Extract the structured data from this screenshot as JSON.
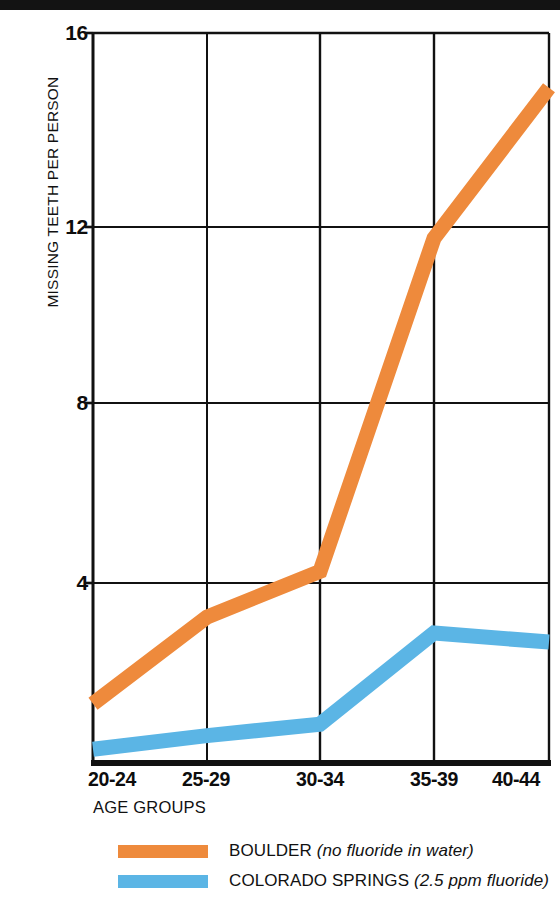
{
  "chart_data": {
    "type": "line",
    "title": "",
    "xlabel": "AGE GROUPS",
    "ylabel": "MISSING TEETH PER PERSON",
    "categories": [
      "20-24",
      "25-29",
      "30-34",
      "35-39",
      "40-44"
    ],
    "ylim": [
      0,
      16
    ],
    "yticks": [
      4,
      8,
      12,
      16
    ],
    "ytick_labels": [
      "4",
      "8",
      "12",
      "16"
    ],
    "grid": "vertical-and-horizontal",
    "legend_position": "bottom",
    "series": [
      {
        "name": "BOULDER",
        "note": "(no fluoride in water)",
        "color": "#ee8a3c",
        "values": [
          1.3,
          3.2,
          4.2,
          11.5,
          14.8
        ]
      },
      {
        "name": "COLORADO SPRINGS",
        "note": "(2.5 ppm fluoride)",
        "color": "#5bb5e5",
        "values": [
          0.3,
          0.6,
          0.85,
          2.85,
          2.65
        ]
      }
    ]
  },
  "axis": {
    "y_label": "MISSING TEETH PER PERSON",
    "x_label": "AGE GROUPS",
    "y_ticks": [
      "16",
      "12",
      "8",
      "4"
    ],
    "x_ticks": [
      "20-24",
      "25-29",
      "30-34",
      "35-39",
      "40-44"
    ]
  },
  "legend": {
    "items": [
      {
        "swatch_color": "#ee8a3c",
        "label": "BOULDER",
        "note": "(no fluoride in water)"
      },
      {
        "swatch_color": "#5bb5e5",
        "label": "COLORADO SPRINGS",
        "note": "(2.5 ppm fluoride)"
      }
    ]
  },
  "colors": {
    "boulder": "#ee8a3c",
    "colorado_springs": "#5bb5e5",
    "axis": "#111111",
    "background": "#ffffff"
  }
}
